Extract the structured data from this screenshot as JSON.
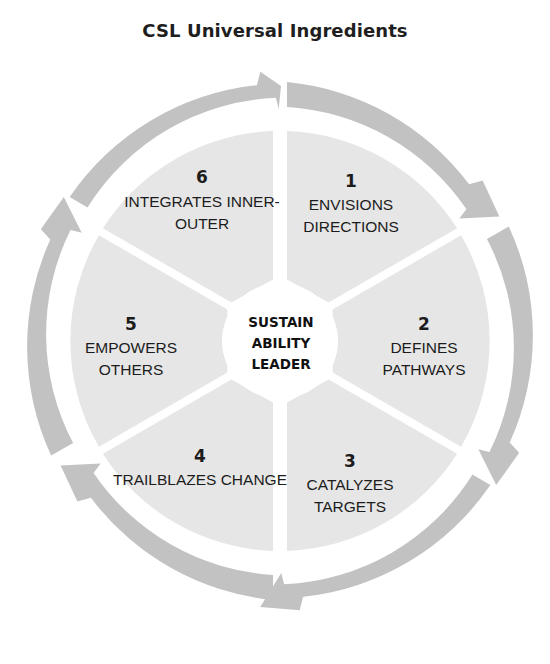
{
  "title": "CSL Universal Ingredients",
  "colors": {
    "background": "#ffffff",
    "sector_fill": "#e6e6e6",
    "arrow_fill": "#c2c2c2",
    "hub_fill": "#ffffff",
    "text": "#1c1c1c"
  },
  "hub": {
    "lines": [
      "SUSTAIN",
      "ABILITY",
      "LEADER"
    ]
  },
  "segments": [
    {
      "number": "1",
      "lines": [
        "ENVISIONS",
        "DIRECTIONS"
      ]
    },
    {
      "number": "2",
      "lines": [
        "DEFINES",
        "PATHWAYS"
      ]
    },
    {
      "number": "3",
      "lines": [
        "CATALYZES",
        "TARGETS"
      ]
    },
    {
      "number": "4",
      "lines": [
        "TRAILBLAZES CHANGE"
      ]
    },
    {
      "number": "5",
      "lines": [
        "EMPOWERS",
        "OTHERS"
      ]
    },
    {
      "number": "6",
      "lines": [
        "INTEGRATES INNER-",
        "OUTER"
      ]
    }
  ],
  "flow_direction": "clockwise"
}
